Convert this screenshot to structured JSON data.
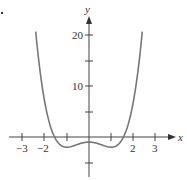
{
  "chart_data": {
    "type": "line",
    "title": "",
    "xlabel": "x",
    "ylabel": "y",
    "xlim": [
      -3.5,
      3.6
    ],
    "ylim": [
      -7,
      23
    ],
    "grid": false,
    "legend": null,
    "x_ticks": [
      -3,
      -2,
      -1,
      0,
      1,
      2,
      3
    ],
    "x_tick_labels": [
      "−3",
      "−2",
      "",
      "",
      "",
      "2",
      "3"
    ],
    "y_ticks": [
      -5,
      5,
      10,
      15,
      20
    ],
    "y_tick_labels": [
      "",
      "",
      "10",
      "",
      "20"
    ],
    "series": [
      {
        "name": "y = x^4 - 2x^2 - 1",
        "color": "#777777",
        "x": [
          -2.4,
          -2.2,
          -2.0,
          -1.8,
          -1.6,
          -1.4,
          -1.2,
          -1.0,
          -0.8,
          -0.6,
          -0.4,
          -0.2,
          0,
          0.2,
          0.4,
          0.6,
          0.8,
          1.0,
          1.2,
          1.4,
          1.6,
          1.8,
          2.0,
          2.2,
          2.4
        ],
        "values": [
          20.7,
          12.7,
          7.0,
          3.0,
          0.4,
          -1.1,
          -1.8,
          -2.0,
          -1.9,
          -1.6,
          -1.3,
          -1.1,
          -1.0,
          -1.1,
          -1.3,
          -1.6,
          -1.9,
          -2.0,
          -1.8,
          -1.1,
          0.4,
          3.0,
          7.0,
          12.7,
          20.7
        ]
      }
    ]
  },
  "labels": {
    "x_axis": "x",
    "y_axis": "y",
    "tick_neg3": "−3",
    "tick_neg2": "−2",
    "tick_2": "2",
    "tick_3": "3",
    "tick_10": "10",
    "tick_20": "20"
  }
}
